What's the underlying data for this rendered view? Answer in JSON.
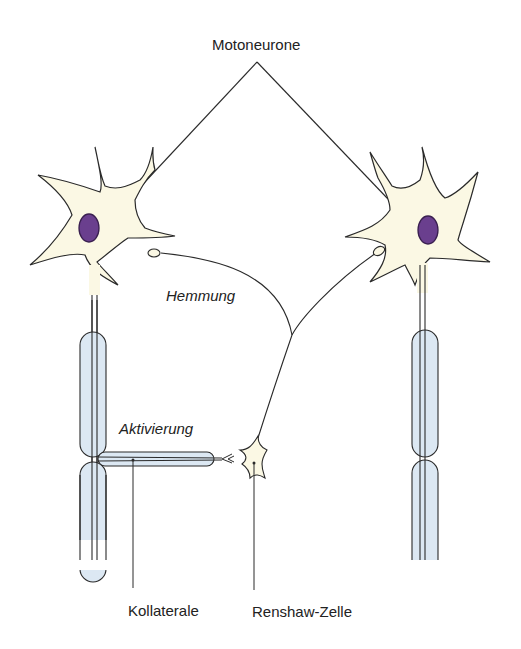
{
  "diagram": {
    "labels": {
      "motoneurons": "Motoneurone",
      "inhibition": "Hemmung",
      "activation": "Aktivierung",
      "collateral": "Kollaterale",
      "renshaw_cell": "Renshaw-Zelle"
    },
    "colors": {
      "soma_fill": "#fbf8e4",
      "nucleus_fill": "#6a3f8e",
      "myelin_fill": "#dce8f3",
      "stroke": "#2a2a2a"
    }
  }
}
